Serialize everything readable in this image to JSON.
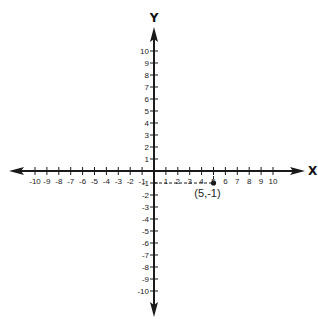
{
  "diagram": {
    "type": "coordinate-plane",
    "x_axis_label": "X",
    "y_axis_label": "Y",
    "x_range": [
      -10,
      10
    ],
    "y_range": [
      -10,
      10
    ],
    "x_ticks": [
      "-10",
      "-9",
      "-8",
      "-7",
      "-6",
      "-5",
      "-4",
      "-3",
      "-2",
      "-1",
      "1",
      "2",
      "3",
      "4",
      "5",
      "6",
      "7",
      "8",
      "9",
      "10"
    ],
    "y_ticks": [
      "10",
      "9",
      "8",
      "7",
      "6",
      "5",
      "4",
      "3",
      "2",
      "1",
      "-1",
      "-2",
      "-3",
      "-4",
      "-5",
      "-6",
      "-7",
      "-8",
      "-9",
      "-10"
    ],
    "point": {
      "x": 5,
      "y": -1,
      "label": "(5,-1)"
    },
    "guide_lines": "dashed",
    "colors": {
      "axis": "#1a1a1a",
      "point": "#1a1a1a",
      "background": "#ffffff"
    }
  }
}
